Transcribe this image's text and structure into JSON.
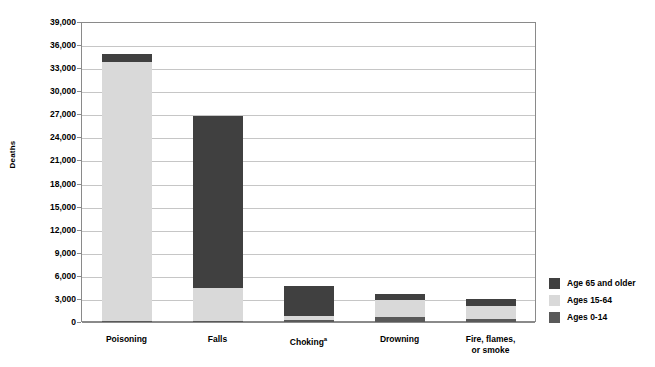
{
  "chart_data": {
    "type": "bar",
    "subtype": "stacked-bar",
    "title": "",
    "xlabel": "",
    "ylabel": "Deaths",
    "ylim": [
      0,
      39000
    ],
    "ytick_step": 3000,
    "ytick_labels": [
      "39,000",
      "36,000",
      "33,000",
      "30,000",
      "27,000",
      "24,000",
      "21,000",
      "18,000",
      "15,000",
      "12,000",
      "9,000",
      "6,000",
      "3,000",
      "0"
    ],
    "ytick_values": [
      39000,
      36000,
      33000,
      30000,
      27000,
      24000,
      21000,
      18000,
      15000,
      12000,
      9000,
      6000,
      3000,
      0
    ],
    "grid": true,
    "grid_axis": "y",
    "legend_position": "right",
    "categories": [
      "Poisoning",
      "Falls",
      "Choking",
      "Drowning",
      "Fire, flames,\nor smoke"
    ],
    "category_footnotes": [
      "",
      "",
      "a",
      "",
      ""
    ],
    "series": [
      {
        "name": "Ages 0-14",
        "color": "#595959",
        "values": [
          180,
          190,
          230,
          620,
          390
        ]
      },
      {
        "name": "Ages 15-64",
        "color": "#d9d9d9",
        "values": [
          33620,
          4200,
          560,
          2300,
          1630
        ]
      },
      {
        "name": "Age 65 and older",
        "color": "#404040",
        "values": [
          1000,
          22400,
          3900,
          680,
          910
        ]
      }
    ],
    "totals": [
      34800,
      26790,
      4690,
      3600,
      2930
    ],
    "stack_order_bottom_to_top": [
      "Ages 0-14",
      "Ages 15-64",
      "Age 65 and older"
    ]
  },
  "legend": {
    "items": [
      {
        "label": "Age 65 and older",
        "color": "#404040"
      },
      {
        "label": "Ages 15-64",
        "color": "#d9d9d9"
      },
      {
        "label": "Ages 0-14",
        "color": "#595959"
      }
    ]
  },
  "axes": {
    "y_title": "Deaths"
  }
}
